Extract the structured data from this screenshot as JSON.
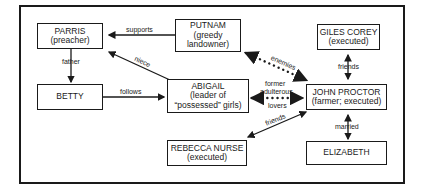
{
  "nodes": {
    "parris": {
      "name": "PARRIS",
      "desc": "(preacher)"
    },
    "putnam": {
      "name": "PUTNAM",
      "desc1": "(greedy",
      "desc2": "landowner)"
    },
    "giles": {
      "name": "GILES COREY",
      "desc": "(executed)"
    },
    "betty": {
      "name": "BETTY"
    },
    "abigail": {
      "name": "ABIGAIL",
      "desc1": "(leader of",
      "desc2": "“possessed” girls)"
    },
    "proctor": {
      "name": "JOHN PROCTOR",
      "desc": "(farmer; executed)"
    },
    "rebecca": {
      "name": "REBECCA NURSE",
      "desc": "(executed)"
    },
    "elizabeth": {
      "name": "ELIZABETH"
    }
  },
  "edges": {
    "supports": "supports",
    "father": "father",
    "niece": "niece",
    "follows": "follows",
    "enemies": "enemies",
    "former1": "former",
    "former2": "adulterous",
    "former3": "lovers",
    "friends_giles": "friends",
    "friends_rebecca": "friends",
    "married": "married"
  },
  "colors": {
    "ink": "#1a1a1a",
    "background": "#ffffff"
  }
}
